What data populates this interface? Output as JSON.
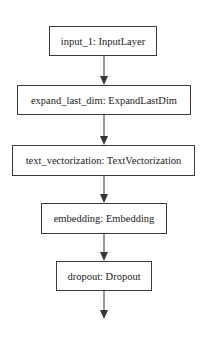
{
  "diagram": {
    "type": "keras-model-plot",
    "direction": "top-to-bottom",
    "colors": {
      "border": "#3a3a3a",
      "text": "#222222",
      "edge": "#333333",
      "background": "#ffffff"
    },
    "nodes": [
      {
        "id": "input_1",
        "label": "input_1: InputLayer"
      },
      {
        "id": "expand_last_dim",
        "label": "expand_last_dim: ExpandLastDim"
      },
      {
        "id": "text_vectorization",
        "label": "text_vectorization: TextVectorization"
      },
      {
        "id": "embedding",
        "label": "embedding: Embedding"
      },
      {
        "id": "dropout",
        "label": "dropout: Dropout"
      }
    ],
    "edges": [
      {
        "from": "input_1",
        "to": "expand_last_dim"
      },
      {
        "from": "expand_last_dim",
        "to": "text_vectorization"
      },
      {
        "from": "text_vectorization",
        "to": "embedding"
      },
      {
        "from": "embedding",
        "to": "dropout"
      },
      {
        "from": "dropout",
        "to": "(continues)"
      }
    ]
  }
}
